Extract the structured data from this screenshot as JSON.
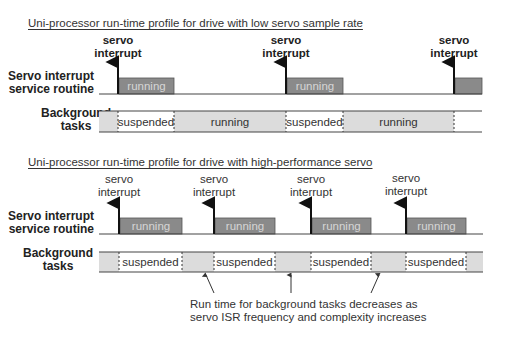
{
  "top": {
    "title": "Uni-processor run-time profile for drive with low servo sample rate",
    "isr_label": [
      "Servo interrupt",
      "service routine"
    ],
    "bg_label": [
      "Background",
      "tasks"
    ],
    "interrupt_label": [
      "servo",
      "interrupt"
    ],
    "interrupts_x": [
      118,
      286,
      454
    ],
    "isr_running": [
      {
        "x1": 119,
        "x2": 174,
        "label": "running"
      },
      {
        "x1": 287,
        "x2": 343,
        "label": "running"
      },
      {
        "x1": 455,
        "x2": 482,
        "label": ""
      }
    ],
    "bg_segments": [
      {
        "x1": 99,
        "x2": 118,
        "state": "running",
        "label": ""
      },
      {
        "x1": 118,
        "x2": 174,
        "state": "suspended",
        "label": "suspended"
      },
      {
        "x1": 174,
        "x2": 286,
        "state": "running",
        "label": "running"
      },
      {
        "x1": 286,
        "x2": 343,
        "state": "suspended",
        "label": "suspended"
      },
      {
        "x1": 343,
        "x2": 454,
        "state": "running",
        "label": "running"
      },
      {
        "x1": 454,
        "x2": 482,
        "state": "suspended",
        "label": ""
      }
    ]
  },
  "bottom": {
    "title": "Uni-processor run-time profile for drive with high-performance servo",
    "isr_label": [
      "Servo interrupt",
      "service routine"
    ],
    "bg_label": [
      "Background",
      "tasks"
    ],
    "interrupt_label": [
      "servo",
      "interrupt"
    ],
    "interrupts_x": [
      119,
      214,
      311,
      406
    ],
    "isr_running": [
      {
        "x1": 120,
        "x2": 182,
        "label": "running"
      },
      {
        "x1": 215,
        "x2": 275,
        "label": "running"
      },
      {
        "x1": 312,
        "x2": 371,
        "label": "running"
      },
      {
        "x1": 407,
        "x2": 466,
        "label": "running"
      }
    ],
    "bg_segments": [
      {
        "x1": 99,
        "x2": 119,
        "state": "running",
        "label": ""
      },
      {
        "x1": 119,
        "x2": 182,
        "state": "suspended",
        "label": "suspended"
      },
      {
        "x1": 182,
        "x2": 214,
        "state": "running",
        "label": ""
      },
      {
        "x1": 214,
        "x2": 275,
        "state": "suspended",
        "label": "suspended"
      },
      {
        "x1": 275,
        "x2": 311,
        "state": "running",
        "label": ""
      },
      {
        "x1": 311,
        "x2": 371,
        "state": "suspended",
        "label": "suspended"
      },
      {
        "x1": 371,
        "x2": 406,
        "state": "running",
        "label": ""
      },
      {
        "x1": 406,
        "x2": 466,
        "state": "suspended",
        "label": "suspended"
      },
      {
        "x1": 466,
        "x2": 483,
        "state": "running",
        "label": ""
      }
    ],
    "caption": [
      "Run time for background tasks decreases as",
      "servo ISR frequency and complexity increases"
    ]
  },
  "colors": {
    "isr_box": "#8a8a8a",
    "isr_text": "#d6d6d6",
    "bg_running": "#dcdcdc",
    "bg_suspended": "#ffffff",
    "line": "#444444"
  }
}
